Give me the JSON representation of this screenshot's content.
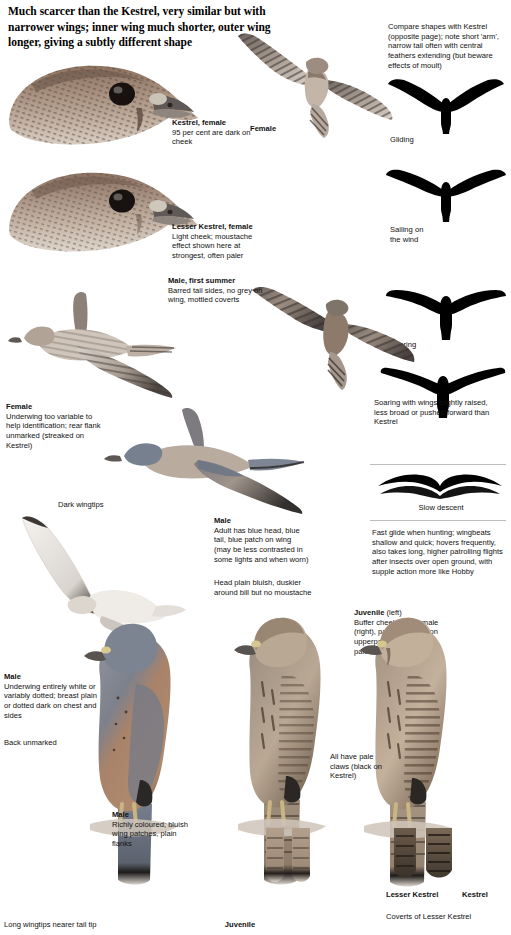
{
  "intro": "Much scarcer than the Kestrel, very similar but with narrower wings; inner wing much shorter, outer wing longer, giving a subtly different shape",
  "captions": {
    "compare_shapes": "Compare shapes with Kestrel (opposite page); note short 'arm', narrow tail often with central feathers extending (but beware effects of moult)",
    "female_flight_top": "Female",
    "kestrel_female_head": {
      "title": "Kestrel, female",
      "text": "95 per cent are dark on cheek"
    },
    "lesser_kestrel_female_head": {
      "title": "Lesser Kestrel, female",
      "text": "Light cheek; moustache effect shown here at strongest, often paler"
    },
    "male_first_summer": {
      "title": "Male, first summer",
      "text": "Barred tail sides, no grey on wing, mottled coverts"
    },
    "female_flight_left": {
      "title": "Female",
      "text": "Underwing too variable to help identification; rear flank unmarked (streaked on Kestrel)"
    },
    "dark_wingtips": "Dark wingtips",
    "male_flight": {
      "title": "Male",
      "text": "Adult has blue head, blue tail, blue patch on wing (may be less contrasted in some lights and when worn)"
    },
    "head_plain": "Head plain bluish, duskier around bill but no moustache",
    "male_underwing": {
      "title": "Male",
      "text": "Underwing entirely white or variably dotted; breast plain or dotted dark on chest and sides"
    },
    "back_unmarked": "Back unmarked",
    "male_perched": {
      "title": "Male",
      "text": "Richly coloured; bluish wing patches, plain flanks"
    },
    "juvenile_perched_label": "Juvenile",
    "juvenile_right": {
      "title": "Juvenile",
      "suffix": "(left)",
      "text": "Buffer cheek than female (right), pale chin; bars on upperparts duller, edged pale"
    },
    "pale_claws": "All have pale claws (black on Kestrel)",
    "long_wingtips": "Long wingtips nearer tail tip",
    "silhouettes": {
      "gliding": "Gliding",
      "sailing": "Sailing on the wind",
      "soaring": "Soaring",
      "soaring_raised": "Soaring with wings slightly raised, less broad or pushed forward than Kestrel",
      "slow_descent": "Slow descent"
    },
    "fast_glide": "Fast glide when hunting; wingbeats shallow and quick; hovers frequently, also takes long, higher patrolling flights after insects over open ground, with supple action more like Hobby",
    "tail_compare": {
      "left_label": "Lesser Kestrel",
      "right_label": "Kestrel",
      "caption": "Coverts of Lesser Kestrel"
    }
  },
  "colors": {
    "ink": "#1a1a1a",
    "silhouette": "#000000",
    "rule": "#bdbdbd",
    "warm_brown": "#9a7554",
    "slate_blue": "#6d7b8c"
  }
}
